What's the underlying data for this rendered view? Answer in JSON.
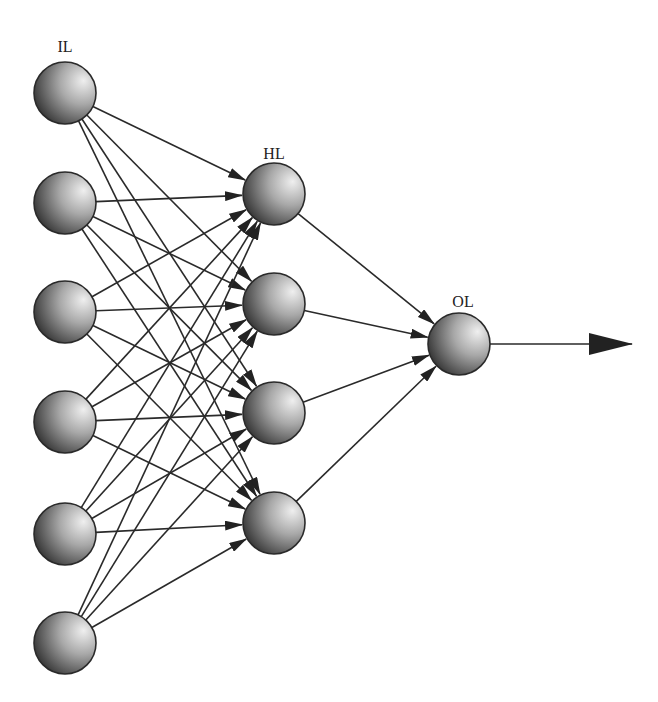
{
  "diagram": {
    "type": "feedforward-neural-network",
    "layers": [
      {
        "id": "input",
        "label": "IL",
        "x": 65,
        "nodes": [
          93,
          203,
          312,
          422,
          534,
          643
        ],
        "label_pos": [
          65,
          50
        ]
      },
      {
        "id": "hidden",
        "label": "HL",
        "x": 274,
        "nodes": [
          194,
          304,
          413,
          523
        ],
        "label_pos": [
          274,
          157
        ]
      },
      {
        "id": "output",
        "label": "OL",
        "x": 459,
        "nodes": [
          344
        ],
        "label_pos": [
          463,
          305
        ]
      }
    ],
    "node_radius": 31,
    "connections": "fully-connected",
    "output_arrow": {
      "from": [
        490,
        344
      ],
      "to": [
        632,
        344
      ]
    },
    "colors": {
      "stroke": "#2a2a2a",
      "node_dark": "#3a3a3a",
      "node_light": "#e6e6e6",
      "background": "#ffffff"
    }
  },
  "labels": {
    "input_layer": "IL",
    "hidden_layer": "HL",
    "output_layer": "OL"
  }
}
